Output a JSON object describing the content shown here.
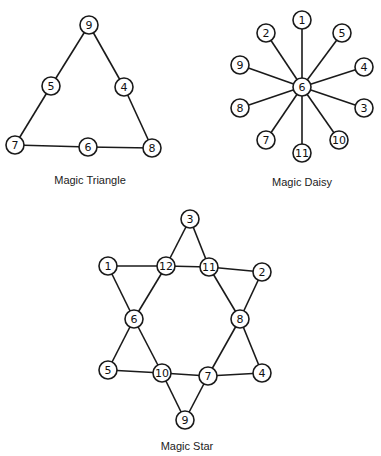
{
  "diagrams": [
    {
      "id": "triangle",
      "caption": "Magic Triangle",
      "caption_pos": [
        90,
        184
      ],
      "nodes": [
        {
          "label": "9",
          "x": 89,
          "y": 25
        },
        {
          "label": "5",
          "x": 51,
          "y": 86
        },
        {
          "label": "4",
          "x": 124,
          "y": 87
        },
        {
          "label": "7",
          "x": 15,
          "y": 145
        },
        {
          "label": "6",
          "x": 88,
          "y": 147
        },
        {
          "label": "8",
          "x": 152,
          "y": 148
        }
      ],
      "edges": [
        [
          0,
          1
        ],
        [
          1,
          3
        ],
        [
          0,
          2
        ],
        [
          2,
          5
        ],
        [
          3,
          4
        ],
        [
          4,
          5
        ]
      ]
    },
    {
      "id": "daisy",
      "caption": "Magic Daisy",
      "caption_pos": [
        302,
        186
      ],
      "nodes": [
        {
          "label": "6",
          "x": 302,
          "y": 87
        },
        {
          "label": "1",
          "x": 302,
          "y": 20
        },
        {
          "label": "2",
          "x": 266,
          "y": 33
        },
        {
          "label": "5",
          "x": 342,
          "y": 33
        },
        {
          "label": "9",
          "x": 240,
          "y": 65
        },
        {
          "label": "4",
          "x": 364,
          "y": 67
        },
        {
          "label": "8",
          "x": 240,
          "y": 108
        },
        {
          "label": "3",
          "x": 364,
          "y": 108
        },
        {
          "label": "7",
          "x": 266,
          "y": 140
        },
        {
          "label": "10",
          "x": 339,
          "y": 140
        },
        {
          "label": "11",
          "x": 302,
          "y": 153
        }
      ],
      "edges": [
        [
          0,
          1
        ],
        [
          0,
          2
        ],
        [
          0,
          3
        ],
        [
          0,
          4
        ],
        [
          0,
          5
        ],
        [
          0,
          6
        ],
        [
          0,
          7
        ],
        [
          0,
          8
        ],
        [
          0,
          9
        ],
        [
          0,
          10
        ]
      ]
    },
    {
      "id": "star",
      "caption": "Magic Star",
      "caption_pos": [
        187,
        450
      ],
      "nodes": [
        {
          "label": "3",
          "x": 190,
          "y": 219
        },
        {
          "label": "1",
          "x": 108,
          "y": 266
        },
        {
          "label": "12",
          "x": 166,
          "y": 266
        },
        {
          "label": "11",
          "x": 209,
          "y": 267
        },
        {
          "label": "2",
          "x": 262,
          "y": 272
        },
        {
          "label": "6",
          "x": 134,
          "y": 319
        },
        {
          "label": "8",
          "x": 240,
          "y": 319
        },
        {
          "label": "5",
          "x": 108,
          "y": 370
        },
        {
          "label": "10",
          "x": 162,
          "y": 373
        },
        {
          "label": "7",
          "x": 208,
          "y": 376
        },
        {
          "label": "4",
          "x": 262,
          "y": 373
        },
        {
          "label": "9",
          "x": 185,
          "y": 420
        }
      ],
      "edges": [
        [
          0,
          2
        ],
        [
          0,
          3
        ],
        [
          1,
          2
        ],
        [
          2,
          3
        ],
        [
          3,
          4
        ],
        [
          1,
          5
        ],
        [
          2,
          5
        ],
        [
          3,
          6
        ],
        [
          4,
          6
        ],
        [
          5,
          7
        ],
        [
          5,
          8
        ],
        [
          6,
          9
        ],
        [
          6,
          10
        ],
        [
          7,
          8
        ],
        [
          8,
          9
        ],
        [
          9,
          10
        ],
        [
          8,
          11
        ],
        [
          9,
          11
        ]
      ]
    }
  ]
}
